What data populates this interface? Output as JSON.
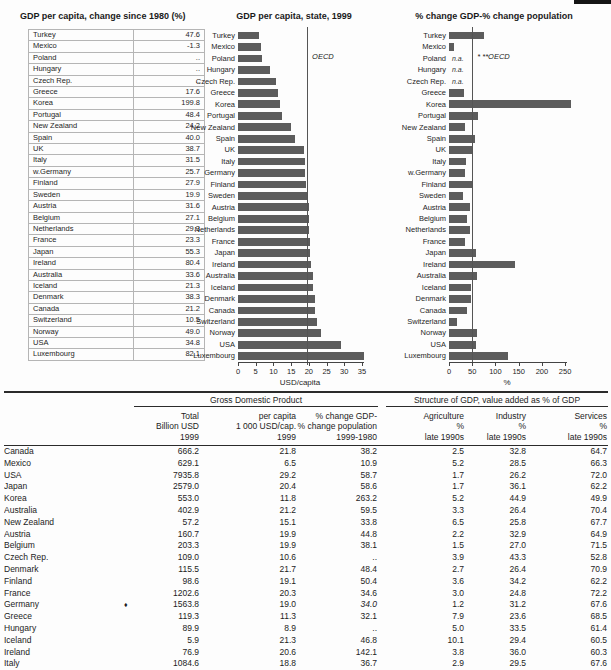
{
  "colors": {
    "bar": "#5c5c5c",
    "rule": "#2b2b2b",
    "grid": "#b5b5b5"
  },
  "left_table": {
    "title": "GDP per capita, change since 1980 (%)",
    "rows": [
      [
        "Turkey",
        "47.6"
      ],
      [
        "Mexico",
        "-1.3"
      ],
      [
        "Poland",
        ".."
      ],
      [
        "Hungary",
        ".."
      ],
      [
        "Czech Rep.",
        ".."
      ],
      [
        "Greece",
        "17.6"
      ],
      [
        "Korea",
        "199.8"
      ],
      [
        "Portugal",
        "48.4"
      ],
      [
        "New Zealand",
        "24.2"
      ],
      [
        "Spain",
        "40.0"
      ],
      [
        "UK",
        "38.7"
      ],
      [
        "Italy",
        "31.5"
      ],
      [
        "w.Germany",
        "25.7"
      ],
      [
        "Finland",
        "27.9"
      ],
      [
        "Sweden",
        "19.9"
      ],
      [
        "Austria",
        "31.6"
      ],
      [
        "Belgium",
        "27.1"
      ],
      [
        "Netherlands",
        "29.3"
      ],
      [
        "France",
        "23.3"
      ],
      [
        "Japan",
        "55.3"
      ],
      [
        "Ireland",
        "80.4"
      ],
      [
        "Australia",
        "33.6"
      ],
      [
        "Iceland",
        "21.3"
      ],
      [
        "Denmark",
        "38.3"
      ],
      [
        "Canada",
        "21.2"
      ],
      [
        "Switzerland",
        "10.5"
      ],
      [
        "Norway",
        "49.0"
      ],
      [
        "USA",
        "34.8"
      ],
      [
        "Luxembourg",
        "82.1"
      ]
    ]
  },
  "chart_data": [
    {
      "type": "bar",
      "orientation": "horizontal",
      "title": "GDP per capita, state, 1999",
      "xlabel": "USD/capita",
      "xlim": [
        0,
        35
      ],
      "ticks": [
        0,
        5,
        10,
        15,
        20,
        25,
        30,
        35
      ],
      "ref_line": {
        "value": 19.5,
        "label": "OECD"
      },
      "categories": [
        "Turkey",
        "Mexico",
        "Poland",
        "Hungary",
        "Czech Rep.",
        "Greece",
        "Korea",
        "Portugal",
        "New Zealand",
        "Spain",
        "UK",
        "Italy",
        "Germany",
        "Finland",
        "Sweden",
        "Austria",
        "Belgium",
        "Netherlands",
        "France",
        "Japan",
        "Ireland",
        "Australia",
        "Iceland",
        "Denmark",
        "Canada",
        "Switzerland",
        "Norway",
        "USA",
        "Luxembourg"
      ],
      "values": [
        6.0,
        6.5,
        6.8,
        8.9,
        10.6,
        11.3,
        11.8,
        12.4,
        15.1,
        16.0,
        18.6,
        18.8,
        19.0,
        19.1,
        19.6,
        19.9,
        19.9,
        20.0,
        20.3,
        20.4,
        20.6,
        21.2,
        21.3,
        21.7,
        21.8,
        22.3,
        23.4,
        29.2,
        35.5
      ]
    },
    {
      "type": "bar",
      "orientation": "horizontal",
      "title": "% change GDP-% change population",
      "xlabel": "%",
      "xlim": [
        0,
        250
      ],
      "ticks": [
        0,
        50,
        100,
        150,
        200,
        250
      ],
      "ref_line": {
        "value": 50,
        "label": "* **OECD"
      },
      "na_text": "n.a.",
      "categories": [
        "Turkey",
        "Mexico",
        "Poland",
        "Hungary",
        "Czech Rep.",
        "Greece",
        "Korea",
        "Portugal",
        "New Zealand",
        "Spain",
        "UK",
        "Italy",
        "w.Germany",
        "Finland",
        "Sweden",
        "Austria",
        "Belgium",
        "Netherlands",
        "France",
        "Japan",
        "Ireland",
        "Australia",
        "Iceland",
        "Denmark",
        "Canada",
        "Switzerland",
        "Norway",
        "USA",
        "Luxembourg"
      ],
      "values": [
        75,
        10.9,
        null,
        null,
        null,
        32.1,
        263.2,
        62,
        33.8,
        55,
        49,
        36.7,
        34.0,
        50.4,
        30,
        44.8,
        38.1,
        45,
        34.6,
        58.6,
        142.1,
        59.5,
        46.8,
        48.4,
        38.2,
        17,
        61,
        58.7,
        127
      ]
    }
  ],
  "bottom_table": {
    "group_headers": [
      "Gross Domestic Product",
      "Structure of GDP, value added as % of GDP"
    ],
    "col_headers": [
      "",
      "Total\nBillion USD\n1999",
      "per capita\n1 000 USD/cap.\n1999",
      "% change GDP-\n% change population\n1999-1980",
      "Agriculture\n%\nlate 1990s",
      "Industry\n%\nlate 1990s",
      "Services\n%\nlate 1990s"
    ],
    "rows": [
      {
        "cells": [
          "Canada",
          "666.2",
          "21.8",
          "38.2",
          "2.5",
          "32.8",
          "64.7"
        ]
      },
      {
        "cells": [
          "Mexico",
          "629.1",
          "6.5",
          "10.9",
          "5.2",
          "28.5",
          "66.3"
        ]
      },
      {
        "cells": [
          "USA",
          "7935.8",
          "29.2",
          "58.7",
          "1.7",
          "26.2",
          "72.0"
        ]
      },
      {
        "cells": [
          "Japan",
          "2579.0",
          "20.4",
          "58.6",
          "1.7",
          "36.1",
          "62.2"
        ]
      },
      {
        "cells": [
          "Korea",
          "553.0",
          "11.8",
          "263.2",
          "5.2",
          "44.9",
          "49.9"
        ]
      },
      {
        "cells": [
          "Australia",
          "402.9",
          "21.2",
          "59.5",
          "3.3",
          "26.4",
          "70.4"
        ]
      },
      {
        "cells": [
          "New Zealand",
          "57.2",
          "15.1",
          "33.8",
          "6.5",
          "25.8",
          "67.7"
        ]
      },
      {
        "cells": [
          "Austria",
          "160.7",
          "19.9",
          "44.8",
          "2.2",
          "32.9",
          "64.9"
        ]
      },
      {
        "cells": [
          "Belgium",
          "203.3",
          "19.9",
          "38.1",
          "1.5",
          "27.0",
          "71.5"
        ]
      },
      {
        "cells": [
          "Czech Rep.",
          "109.0",
          "10.6",
          "..",
          "3.9",
          "43.3",
          "52.8"
        ]
      },
      {
        "cells": [
          "Denmark",
          "115.5",
          "21.7",
          "48.4",
          "2.7",
          "26.4",
          "70.9"
        ]
      },
      {
        "cells": [
          "Finland",
          "98.6",
          "19.1",
          "50.4",
          "3.6",
          "34.2",
          "62.2"
        ]
      },
      {
        "cells": [
          "France",
          "1202.6",
          "20.3",
          "34.6",
          "3.0",
          "24.8",
          "72.2"
        ]
      },
      {
        "cells": [
          "Germany",
          "1563.8",
          "19.0",
          "34.0",
          "1.2",
          "31.2",
          "67.6"
        ],
        "marker": "♦",
        "italic": [
          3
        ]
      },
      {
        "cells": [
          "Greece",
          "119.3",
          "11.3",
          "32.1",
          "7.9",
          "23.6",
          "68.5"
        ]
      },
      {
        "cells": [
          "Hungary",
          "89.9",
          "8.9",
          "..",
          "5.0",
          "33.5",
          "61.4"
        ]
      },
      {
        "cells": [
          "Iceland",
          "5.9",
          "21.3",
          "46.8",
          "10.1",
          "29.4",
          "60.5"
        ]
      },
      {
        "cells": [
          "Ireland",
          "76.9",
          "20.6",
          "142.1",
          "3.8",
          "36.0",
          "60.3"
        ]
      },
      {
        "cells": [
          "Italy",
          "1084.6",
          "18.8",
          "36.7",
          "2.9",
          "29.5",
          "67.6"
        ]
      }
    ]
  }
}
